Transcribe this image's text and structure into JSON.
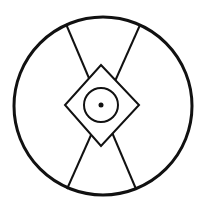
{
  "diagram": {
    "background": "#ffffff",
    "stroke": "#111111",
    "outer_circle": {
      "cx": 103,
      "cy": 106,
      "r": 89,
      "stroke_width": 3
    },
    "cross_lines": [
      {
        "x1": 66,
        "y1": 24,
        "x2": 136,
        "y2": 189
      },
      {
        "x1": 140,
        "y1": 25,
        "x2": 67,
        "y2": 189
      }
    ],
    "diamond": {
      "points": "101,65 139,105 101,146 65,105",
      "stroke_width": 2
    },
    "inner_circle": {
      "cx": 101,
      "cy": 105,
      "r": 17,
      "stroke_width": 2
    },
    "center_dot": {
      "cx": 101,
      "cy": 105,
      "r": 2.5
    }
  }
}
